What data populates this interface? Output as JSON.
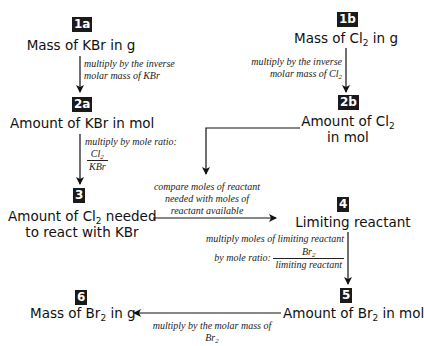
{
  "diagram": {
    "type": "flowchart",
    "topic": "Limiting reactant stoichiometry: KBr + Cl2 to Br2",
    "nodes": [
      {
        "id": "1a",
        "badge": "1a",
        "text": "Mass of KBr in g"
      },
      {
        "id": "2a",
        "badge": "2a",
        "text": "Amount of KBr in mol"
      },
      {
        "id": "3",
        "badge": "3",
        "line1_pre": "Amount of Cl",
        "line1_sub": "2",
        "line1_post": " needed",
        "line2": "to react with KBr"
      },
      {
        "id": "1b",
        "badge": "1b",
        "pre": "Mass of Cl",
        "sub": "2",
        "post": " in g"
      },
      {
        "id": "2b",
        "badge": "2b",
        "line1_pre": "Amount of Cl",
        "line1_sub": "2",
        "line2": "in mol"
      },
      {
        "id": "4",
        "badge": "4",
        "text": "Limiting reactant"
      },
      {
        "id": "5",
        "badge": "5",
        "pre": "Amount of Br",
        "sub": "2",
        "post": " in mol"
      },
      {
        "id": "6",
        "badge": "6",
        "pre": "Mass of Br",
        "sub": "2",
        "post": " in g"
      }
    ],
    "edges": [
      {
        "from": "1a",
        "to": "2a",
        "line1": "multiply by the inverse",
        "line2": "molar mass of KBr"
      },
      {
        "from": "2a",
        "to": "3",
        "line1": "multiply by mole ratio:",
        "num_pre": "Cl",
        "num_sub": "2",
        "den": "KBr"
      },
      {
        "from": "1b",
        "to": "2b",
        "line1": "multiply by the inverse",
        "line2_pre": "molar mass of Cl",
        "line2_sub": "2"
      },
      {
        "from": "3",
        "to": "4",
        "line1": "compare moles of reactant",
        "line2": "needed with moles of",
        "line3": "reactant available"
      },
      {
        "from": "2b",
        "to": "compare",
        "label": ""
      },
      {
        "from": "4",
        "to": "5",
        "line1": "multiply moles of limiting reactant",
        "line2": "by mole ratio:",
        "num_pre": "Br",
        "num_sub": "2",
        "den": "limiting reactant"
      },
      {
        "from": "5",
        "to": "6",
        "line1": "multiply by the molar mass of",
        "line2_pre": "Br",
        "line2_sub": "2"
      }
    ]
  }
}
